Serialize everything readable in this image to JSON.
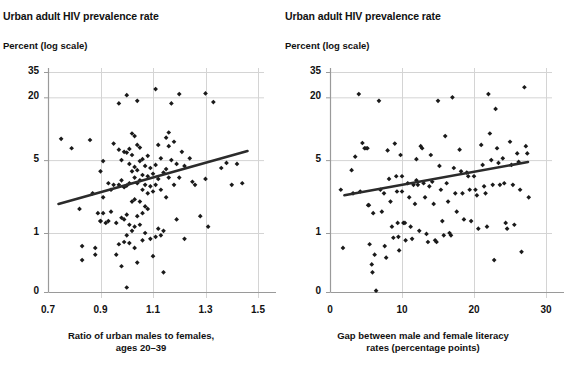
{
  "figure": {
    "panels": [
      {
        "id": "left",
        "title": "Urban adult HIV prevalence rate",
        "y_axis_note": "Percent (log scale)",
        "x_label_line1": "Ratio of urban males to females,",
        "x_label_line2": "ages 20–39"
      },
      {
        "id": "right",
        "title": "Urban adult HIV prevalence rate",
        "y_axis_note": "Percent (log scale)",
        "x_label_line1": "Gap between male and female literacy",
        "x_label_line2": "rates (percentage points)"
      }
    ],
    "colors": {
      "marker": "#1a1a1a",
      "trendline": "#2b2b2b",
      "gridline": "#d4d4d4",
      "axis": "#9a9a9a",
      "text": "#111111"
    }
  },
  "chart_data": [
    {
      "type": "scatter",
      "panel": "left",
      "title": "Urban adult HIV prevalence rate",
      "subtitle": "Percent (log scale)",
      "xlabel": "Ratio of urban males to females, ages 20–39",
      "ylabel": "Percent (log scale)",
      "yscale": "log",
      "ylim": [
        0,
        35
      ],
      "yticks": [
        0,
        1,
        5,
        20,
        35
      ],
      "ytick_labels": [
        "0",
        "1",
        "5",
        "20",
        "35"
      ],
      "xlim": [
        0.7,
        1.5
      ],
      "xticks": [
        0.7,
        0.9,
        1.1,
        1.3,
        1.5
      ],
      "xtick_labels": [
        "0.7",
        "0.9",
        "1.1",
        "1.3",
        "1.5"
      ],
      "grid": true,
      "legend": "none",
      "trendline": {
        "x": [
          0.74,
          1.46
        ],
        "y": [
          1.9,
          6.1
        ]
      },
      "points": [
        [
          0.75,
          8.0
        ],
        [
          0.79,
          6.5
        ],
        [
          0.82,
          1.7
        ],
        [
          0.83,
          0.75
        ],
        [
          0.83,
          0.55
        ],
        [
          0.86,
          7.8
        ],
        [
          0.87,
          2.4
        ],
        [
          0.88,
          0.72
        ],
        [
          0.88,
          0.62
        ],
        [
          0.89,
          1.55
        ],
        [
          0.9,
          3.9
        ],
        [
          0.9,
          1.3
        ],
        [
          0.9,
          1.3
        ],
        [
          0.91,
          4.9
        ],
        [
          0.91,
          2.2
        ],
        [
          0.91,
          1.55
        ],
        [
          0.92,
          1.25
        ],
        [
          0.93,
          3.0
        ],
        [
          0.93,
          1.3
        ],
        [
          0.94,
          2.6
        ],
        [
          0.94,
          1.6
        ],
        [
          0.95,
          7.2
        ],
        [
          0.95,
          2.9
        ],
        [
          0.96,
          1.25
        ],
        [
          0.96,
          0.62
        ],
        [
          0.97,
          17.5
        ],
        [
          0.97,
          6.3
        ],
        [
          0.97,
          2.9
        ],
        [
          0.97,
          0.78
        ],
        [
          0.98,
          5.0
        ],
        [
          0.98,
          3.2
        ],
        [
          0.98,
          1.4
        ],
        [
          0.98,
          0.48
        ],
        [
          0.99,
          6.0
        ],
        [
          0.99,
          2.75
        ],
        [
          0.99,
          1.35
        ],
        [
          0.99,
          0.82
        ],
        [
          1.0,
          21.0
        ],
        [
          1.0,
          5.9
        ],
        [
          1.0,
          2.85
        ],
        [
          1.0,
          1.5
        ],
        [
          1.0,
          0.95
        ],
        [
          1.0,
          0.3
        ],
        [
          1.01,
          6.4
        ],
        [
          1.01,
          4.6
        ],
        [
          1.01,
          3.0
        ],
        [
          1.01,
          1.2
        ],
        [
          1.01,
          0.8
        ],
        [
          1.02,
          9.0
        ],
        [
          1.02,
          5.6
        ],
        [
          1.02,
          3.9
        ],
        [
          1.02,
          2.0
        ],
        [
          1.02,
          1.05
        ],
        [
          1.03,
          8.5
        ],
        [
          1.03,
          4.3
        ],
        [
          1.03,
          3.4
        ],
        [
          1.03,
          2.1
        ],
        [
          1.03,
          1.15
        ],
        [
          1.03,
          0.72
        ],
        [
          1.04,
          18.5
        ],
        [
          1.04,
          7.0
        ],
        [
          1.04,
          4.0
        ],
        [
          1.04,
          3.0
        ],
        [
          1.04,
          1.45
        ],
        [
          1.04,
          0.52
        ],
        [
          1.05,
          6.6
        ],
        [
          1.05,
          4.9
        ],
        [
          1.05,
          3.2
        ],
        [
          1.05,
          2.0
        ],
        [
          1.05,
          1.2
        ],
        [
          1.06,
          5.1
        ],
        [
          1.06,
          3.6
        ],
        [
          1.06,
          2.6
        ],
        [
          1.06,
          1.55
        ],
        [
          1.06,
          0.85
        ],
        [
          1.07,
          4.4
        ],
        [
          1.07,
          2.9
        ],
        [
          1.07,
          1.8
        ],
        [
          1.07,
          1.0
        ],
        [
          1.08,
          5.5
        ],
        [
          1.08,
          3.5
        ],
        [
          1.08,
          2.4
        ],
        [
          1.08,
          1.7
        ],
        [
          1.09,
          4.2
        ],
        [
          1.09,
          2.8
        ],
        [
          1.09,
          0.88
        ],
        [
          1.1,
          3.7
        ],
        [
          1.1,
          2.5
        ],
        [
          1.1,
          0.6
        ],
        [
          1.11,
          24.0
        ],
        [
          1.11,
          4.5
        ],
        [
          1.11,
          2.9
        ],
        [
          1.11,
          0.92
        ],
        [
          1.12,
          7.0
        ],
        [
          1.12,
          3.3
        ],
        [
          1.12,
          1.1
        ],
        [
          1.13,
          5.2
        ],
        [
          1.13,
          2.6
        ],
        [
          1.13,
          0.95
        ],
        [
          1.14,
          3.8
        ],
        [
          1.14,
          1.05
        ],
        [
          1.14,
          0.42
        ],
        [
          1.15,
          8.2
        ],
        [
          1.15,
          4.1
        ],
        [
          1.15,
          2.2
        ],
        [
          1.16,
          9.2
        ],
        [
          1.16,
          6.8
        ],
        [
          1.16,
          3.4
        ],
        [
          1.17,
          17.5
        ],
        [
          1.17,
          5.0
        ],
        [
          1.18,
          7.5
        ],
        [
          1.18,
          2.9
        ],
        [
          1.19,
          4.6
        ],
        [
          1.19,
          1.35
        ],
        [
          1.2,
          21.5
        ],
        [
          1.2,
          3.4
        ],
        [
          1.21,
          6.0
        ],
        [
          1.22,
          4.4
        ],
        [
          1.22,
          0.88
        ],
        [
          1.24,
          5.2
        ],
        [
          1.25,
          3.1
        ],
        [
          1.26,
          2.9
        ],
        [
          1.28,
          1.45
        ],
        [
          1.3,
          21.8
        ],
        [
          1.3,
          3.3
        ],
        [
          1.31,
          1.15
        ],
        [
          1.33,
          18.0
        ],
        [
          1.36,
          4.2
        ],
        [
          1.38,
          4.7
        ],
        [
          1.4,
          2.9
        ],
        [
          1.42,
          4.6
        ],
        [
          1.44,
          3.0
        ]
      ]
    },
    {
      "type": "scatter",
      "panel": "right",
      "title": "Urban adult HIV prevalence rate",
      "subtitle": "Percent (log scale)",
      "xlabel": "Gap between male and female literacy rates (percentage points)",
      "ylabel": "Percent (log scale)",
      "yscale": "log",
      "ylim": [
        0,
        35
      ],
      "yticks": [
        0,
        1,
        5,
        20,
        35
      ],
      "ytick_labels": [
        "0",
        "1",
        "5",
        "20",
        "35"
      ],
      "xlim": [
        0,
        30
      ],
      "xticks": [
        0,
        10,
        20,
        30
      ],
      "xtick_labels": [
        "0",
        "10",
        "20",
        "30"
      ],
      "grid": true,
      "legend": "none",
      "trendline": {
        "x": [
          2.0,
          27.5
        ],
        "y": [
          2.3,
          4.8
        ]
      },
      "points": [
        [
          1.5,
          2.6
        ],
        [
          1.8,
          0.72
        ],
        [
          3.0,
          4.0
        ],
        [
          3.2,
          2.4
        ],
        [
          3.5,
          5.4
        ],
        [
          4.0,
          21.5
        ],
        [
          4.2,
          2.5
        ],
        [
          4.5,
          7.3
        ],
        [
          4.8,
          6.5
        ],
        [
          5.0,
          6.5
        ],
        [
          5.2,
          6.5
        ],
        [
          5.3,
          1.85
        ],
        [
          5.4,
          1.85
        ],
        [
          5.5,
          0.78
        ],
        [
          5.8,
          0.5
        ],
        [
          5.9,
          0.42
        ],
        [
          6.0,
          1.55
        ],
        [
          6.2,
          0.62
        ],
        [
          6.4,
          0.28
        ],
        [
          6.8,
          18.5
        ],
        [
          7.0,
          2.6
        ],
        [
          7.2,
          1.6
        ],
        [
          7.5,
          2.4
        ],
        [
          7.6,
          0.75
        ],
        [
          7.8,
          0.58
        ],
        [
          8.0,
          6.2
        ],
        [
          8.2,
          3.3
        ],
        [
          8.4,
          2.0
        ],
        [
          8.6,
          1.15
        ],
        [
          8.8,
          0.9
        ],
        [
          9.0,
          7.2
        ],
        [
          9.2,
          3.5
        ],
        [
          9.3,
          2.5
        ],
        [
          9.4,
          1.25
        ],
        [
          9.5,
          0.92
        ],
        [
          9.6,
          0.68
        ],
        [
          9.8,
          5.6
        ],
        [
          10.0,
          3.5
        ],
        [
          10.0,
          2.5
        ],
        [
          10.2,
          1.25
        ],
        [
          10.4,
          1.25
        ],
        [
          10.5,
          0.85
        ],
        [
          10.8,
          3.0
        ],
        [
          11.0,
          2.2
        ],
        [
          11.2,
          1.15
        ],
        [
          11.4,
          0.88
        ],
        [
          11.6,
          2.9
        ],
        [
          11.8,
          1.9
        ],
        [
          12.0,
          5.1
        ],
        [
          12.0,
          3.2
        ],
        [
          12.2,
          2.9
        ],
        [
          12.4,
          1.05
        ],
        [
          12.6,
          6.8
        ],
        [
          12.8,
          6.5
        ],
        [
          13.0,
          3.0
        ],
        [
          13.2,
          2.2
        ],
        [
          13.4,
          0.98
        ],
        [
          13.6,
          0.82
        ],
        [
          13.8,
          2.8
        ],
        [
          14.0,
          5.6
        ],
        [
          14.2,
          3.1
        ],
        [
          14.4,
          1.9
        ],
        [
          14.6,
          0.85
        ],
        [
          14.8,
          0.82
        ],
        [
          15.0,
          18.5
        ],
        [
          15.2,
          4.4
        ],
        [
          15.4,
          2.6
        ],
        [
          15.6,
          1.3
        ],
        [
          15.8,
          0.95
        ],
        [
          16.0,
          8.5
        ],
        [
          16.2,
          3.0
        ],
        [
          16.4,
          2.0
        ],
        [
          16.6,
          1.0
        ],
        [
          16.8,
          0.95
        ],
        [
          17.0,
          20.0
        ],
        [
          17.2,
          4.2
        ],
        [
          17.4,
          2.4
        ],
        [
          17.6,
          1.6
        ],
        [
          18.0,
          6.3
        ],
        [
          18.2,
          3.9
        ],
        [
          18.4,
          2.4
        ],
        [
          18.6,
          1.35
        ],
        [
          19.0,
          3.8
        ],
        [
          19.2,
          3.5
        ],
        [
          19.4,
          2.6
        ],
        [
          19.6,
          1.3
        ],
        [
          20.0,
          3.5
        ],
        [
          20.2,
          2.6
        ],
        [
          20.4,
          2.3
        ],
        [
          20.6,
          1.1
        ],
        [
          21.0,
          7.0
        ],
        [
          21.2,
          4.5
        ],
        [
          21.4,
          2.8
        ],
        [
          21.6,
          2.4
        ],
        [
          21.8,
          1.15
        ],
        [
          22.0,
          21.5
        ],
        [
          22.2,
          9.0
        ],
        [
          22.4,
          5.0
        ],
        [
          22.6,
          2.9
        ],
        [
          22.8,
          0.55
        ],
        [
          23.0,
          15.5
        ],
        [
          23.2,
          6.5
        ],
        [
          23.4,
          4.7
        ],
        [
          23.6,
          2.9
        ],
        [
          24.0,
          5.2
        ],
        [
          24.2,
          3.0
        ],
        [
          24.4,
          1.25
        ],
        [
          24.6,
          1.1
        ],
        [
          25.0,
          7.5
        ],
        [
          25.2,
          4.5
        ],
        [
          25.4,
          2.9
        ],
        [
          25.6,
          1.2
        ],
        [
          26.0,
          5.8
        ],
        [
          26.2,
          4.8
        ],
        [
          26.4,
          2.6
        ],
        [
          26.6,
          0.66
        ],
        [
          27.0,
          25.0
        ],
        [
          27.2,
          6.8
        ],
        [
          27.4,
          5.8
        ],
        [
          27.6,
          2.2
        ]
      ]
    }
  ]
}
